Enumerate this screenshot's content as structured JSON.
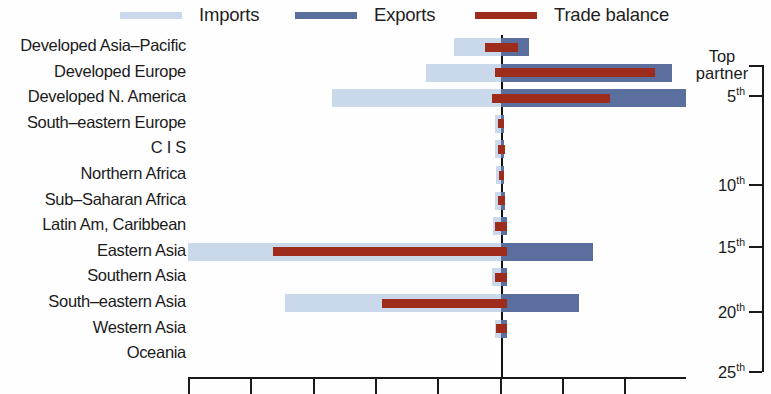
{
  "legend": {
    "items": [
      {
        "label": "Imports",
        "color": "#c9d8ea",
        "name": "imports"
      },
      {
        "label": "Exports",
        "color": "#5a6f9e",
        "name": "exports"
      },
      {
        "label": "Trade balance",
        "color": "#9e2c1c",
        "name": "trade-balance"
      }
    ]
  },
  "right_axis": {
    "caption_line1": "Top",
    "caption_line2": "partner",
    "ticks": [
      {
        "label": "5",
        "suffix": "th"
      },
      {
        "label": "10",
        "suffix": "th"
      },
      {
        "label": "15",
        "suffix": "th"
      },
      {
        "label": "20",
        "suffix": "th"
      },
      {
        "label": "25",
        "suffix": "th"
      }
    ]
  },
  "chart_data": {
    "type": "bar",
    "orientation": "horizontal",
    "layout": "diverging",
    "title": "",
    "xlabel": "",
    "ylabel": "",
    "grid": false,
    "legend_position": "top",
    "zero_at_px": 501,
    "x_tick_count": 8,
    "series": [
      {
        "name": "Imports",
        "color": "#c9d8ea",
        "direction": "left"
      },
      {
        "name": "Exports",
        "color": "#5a6f9e",
        "direction": "right"
      },
      {
        "name": "Trade balance",
        "color": "#9e2c1c",
        "direction": "overlay"
      }
    ],
    "categories": [
      "Developed Asia–Pacific",
      "Developed Europe",
      "Developed N. America",
      "South–eastern Europe",
      "C I S",
      "Northern Africa",
      "Sub–Saharan Africa",
      "Latin Am, Caribbean",
      "Eastern Asia",
      "Southern Asia",
      "South–eastern Asia",
      "Western Asia",
      "Oceania"
    ],
    "rows": [
      {
        "category": "Developed Asia–Pacific",
        "imports": 0.15,
        "exports": 0.1,
        "balance_from": -0.05,
        "balance_to": 0.06
      },
      {
        "category": "Developed Europe",
        "imports": 0.24,
        "exports": 0.61,
        "balance_from": -0.02,
        "balance_to": 0.55
      },
      {
        "category": "Developed N. America",
        "imports": 0.54,
        "exports": 0.66,
        "balance_from": -0.03,
        "balance_to": 0.39
      },
      {
        "category": "South–eastern Europe",
        "imports": 0.02,
        "exports": 0.01,
        "balance_from": -0.01,
        "balance_to": 0.01
      },
      {
        "category": "C I S",
        "imports": 0.02,
        "exports": 0.01,
        "balance_from": -0.01,
        "balance_to": 0.015
      },
      {
        "category": "Northern Africa",
        "imports": 0.015,
        "exports": 0.01,
        "balance_from": -0.005,
        "balance_to": 0.01
      },
      {
        "category": "Sub–Saharan Africa",
        "imports": 0.02,
        "exports": 0.015,
        "balance_from": -0.01,
        "balance_to": 0.015
      },
      {
        "category": "Latin Am, Caribbean",
        "imports": 0.025,
        "exports": 0.02,
        "balance_from": -0.02,
        "balance_to": 0.02
      },
      {
        "category": "Eastern Asia",
        "imports": 1.0,
        "exports": 0.33,
        "balance_from": -0.73,
        "balance_to": 0.02
      },
      {
        "category": "Southern Asia",
        "imports": 0.03,
        "exports": 0.02,
        "balance_from": -0.02,
        "balance_to": 0.02
      },
      {
        "category": "South–eastern Asia",
        "imports": 0.69,
        "exports": 0.28,
        "balance_from": -0.38,
        "balance_to": 0.02
      },
      {
        "category": "Western Asia",
        "imports": 0.02,
        "exports": 0.02,
        "balance_from": -0.015,
        "balance_to": 0.02
      },
      {
        "category": "Oceania",
        "imports": 0.0,
        "exports": 0.0,
        "balance_from": 0.0,
        "balance_to": 0.0
      }
    ]
  }
}
